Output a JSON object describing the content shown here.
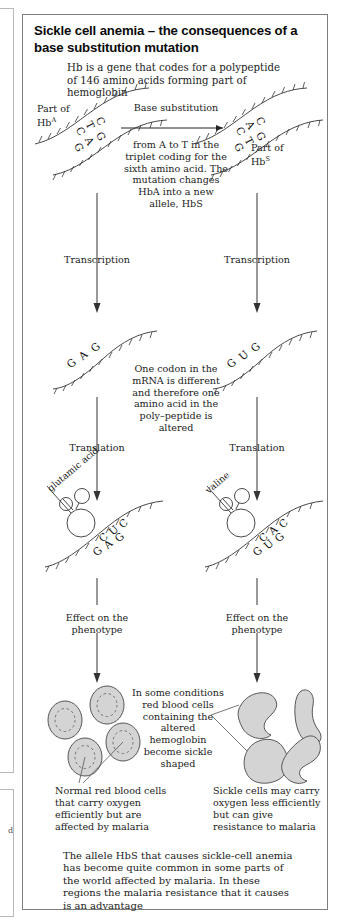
{
  "figure": {
    "title": "Sickle cell anemia – the consequences of a base substitution mutation",
    "intro": "Hb is a gene that codes for a polypeptide of 146 amino acids forming part of hemoglobin",
    "footnote": "The allele HbS that causes sickle-cell anemia has become quite common in some parts of the world affected by malaria. In these regions the malaria resistance that it causes is an advantage"
  },
  "labels": {
    "part_of_hba": "Part of",
    "part_of_hba_sup": "A",
    "hb_prefix": "Hb",
    "part_of_hbs": "Part of",
    "part_of_hbs_sup": "S",
    "transcription_left": "Transcription",
    "transcription_right": "Transcription",
    "translation_left": "Translation",
    "translation_right": "Translation",
    "effect_left": "Effect on the phenotype",
    "effect_right": "Effect on the phenotype",
    "glutamic_acid": "glutamic acid",
    "valine": "valine"
  },
  "center": {
    "base_substitution_heading": "Base substitution",
    "base_substitution_body": "from A to T in the triplet coding for the sixth amino acid. The mutation changes HbA into a new allele, HbS",
    "codon_note": "One codon in the mRNA is different and therefore one amino acid in the poly–peptide is altered",
    "sickle_note": "In some conditions red blood cells containing the altered hemoglobin become sickle shaped"
  },
  "captions": {
    "normal_cells": "Normal red blood cells that carry oxygen efficiently but are affected by malaria",
    "sickle_cells": "Sickle cells may carry oxygen less efficiently but can give resistance to malaria"
  },
  "sequences": {
    "dna_hba_top": [
      "C",
      "T",
      "C"
    ],
    "dna_hba_bottom": [
      "G",
      "A",
      "G"
    ],
    "dna_hbs_top": [
      "C",
      "A",
      "C"
    ],
    "dna_hbs_bottom": [
      "G",
      "T",
      "G"
    ],
    "mrna_left": [
      "G",
      "A",
      "G"
    ],
    "mrna_right": [
      "G",
      "U",
      "G"
    ],
    "trna_left_anticodon": [
      "C",
      "U",
      "C"
    ],
    "trna_left_codon": [
      "G",
      "A",
      "G"
    ],
    "trna_right_anticodon": [
      "C",
      "A",
      "C"
    ],
    "trna_right_codon": [
      "G",
      "U",
      "G"
    ]
  },
  "colors": {
    "frame": "#7d7d7d",
    "text": "#1c1c1c",
    "title": "#0b0b0b",
    "cell_fill": "#d4d4d4",
    "cell_stroke": "#555555",
    "line": "#333333"
  }
}
